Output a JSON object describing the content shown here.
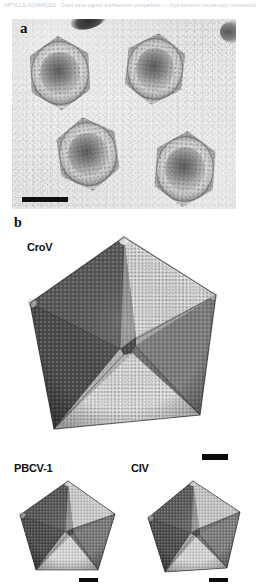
{
  "header": {
    "caption_text": "ARTICLE ADVANCES · Giant virus capsid architecture comparison — cryo-electron microscopy reconstruction study",
    "highlight_text": "Supplementary Figure"
  },
  "figure": {
    "panels": [
      {
        "id": "a",
        "label": "a",
        "type": "tem-micrograph",
        "description": "Negative-stain transmission electron micrograph of four hexagonal virus particles with dense cores on a grainy light background",
        "particle_count": 4,
        "scalebar": {
          "name": "scalebar-panel-a",
          "visible": true
        }
      },
      {
        "id": "b",
        "label": "b",
        "type": "cryoem-reconstruction-set",
        "capsids": [
          {
            "name": "CroV",
            "label": "CroV",
            "size": "large",
            "scalebar": {
              "name": "scalebar-crov",
              "visible": true
            }
          },
          {
            "name": "PBCV-1",
            "label": "PBCV-1",
            "size": "small",
            "scalebar": {
              "name": "scalebar-pbcv1",
              "visible": true
            }
          },
          {
            "name": "CIV",
            "label": "CIV",
            "size": "small",
            "scalebar": {
              "name": "scalebar-civ",
              "visible": true
            }
          }
        ]
      }
    ]
  },
  "colors": {
    "background": "#ffffff",
    "micrograph_base": "#e6e6e4",
    "scalebar": "#0b0b0b",
    "label_text": "#111111",
    "header_text": "#c9c9d2",
    "facet_light": "#e8e8e8",
    "facet_mid": "#9a9a9a",
    "facet_dark": "#4f4f4f",
    "facet_darker": "#3a3a3a"
  }
}
